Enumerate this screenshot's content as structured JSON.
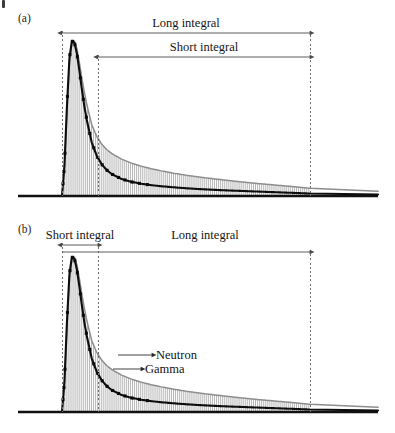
{
  "figure": {
    "kind": "pulse-shape-discrimination-diagram",
    "background_color": "#ffffff",
    "panels": [
      {
        "tag": "(a)",
        "tag_x": 18,
        "tag_y": 22,
        "description": "Neutron and gamma scintillation pulses with long integral starting at pulse onset and short integral starting after the peak",
        "baseline_y": 196,
        "baseline_x0": 18,
        "baseline_x1": 378,
        "gate_lines_x": [
          62,
          98,
          310
        ],
        "bands": [
          {
            "label": "Long integral",
            "label_x": 186,
            "label_y": 27,
            "arrow_y": 33,
            "x_start": 62,
            "x_end": 310,
            "heads": "both"
          },
          {
            "label": "Short integral",
            "label_x": 204,
            "label_y": 51,
            "arrow_y": 57,
            "x_start": 98,
            "x_end": 310,
            "heads": "both"
          }
        ],
        "annotations": []
      },
      {
        "tag": "(b)",
        "tag_x": 18,
        "tag_y": 233,
        "description": "Same pulses with short integral limited to the narrow leading-edge window and long integral spanning the full decay",
        "baseline_y": 412,
        "baseline_x0": 18,
        "baseline_x1": 378,
        "gate_lines_x": [
          62,
          98,
          310
        ],
        "bands": [
          {
            "label": "Short integral",
            "label_x": 80,
            "label_y": 239,
            "arrow_y": 245,
            "x_start": 62,
            "x_end": 98,
            "heads": "both"
          },
          {
            "label": "Long integral",
            "label_x": 205,
            "label_y": 239,
            "arrow_y": 252,
            "x_start": 62,
            "x_end": 310,
            "heads": "end"
          }
        ],
        "annotations": [
          {
            "label": "Neutron",
            "text_x": 156,
            "text_y": 359,
            "arrow_x_start": 118,
            "arrow_x_end": 152,
            "arrow_y": 355
          },
          {
            "label": "Gamma",
            "text_x": 145,
            "text_y": 373,
            "arrow_x_start": 113,
            "arrow_x_end": 141,
            "arrow_y": 369
          }
        ]
      }
    ],
    "colors": {
      "gamma_trace": "#0d0d0d",
      "neutron_trace": "#8d8d8d",
      "fill_hatch": "#a8a8a8",
      "dashed_gate": "#6f6f6f",
      "arrow": "#4a4a4a",
      "baseline": "#111111",
      "text": "#151515"
    }
  },
  "chart_data": {
    "type": "line",
    "title": "",
    "subtitle": "",
    "xlabel": "",
    "ylabel": "",
    "grid": false,
    "legend_position": "inline-annotation",
    "axis_visible": false,
    "xlim": [
      0,
      100
    ],
    "ylim": [
      0,
      1
    ],
    "gates": {
      "pulse_onset_x": 62,
      "peak_x": 74,
      "short_gate_split_x": 98,
      "gate_end_x": 310
    },
    "x": [
      0,
      1,
      2,
      3,
      4,
      5,
      6,
      7,
      8,
      9,
      10,
      12,
      14,
      16,
      18,
      20,
      24,
      28,
      32,
      36,
      40,
      45,
      50,
      55,
      60,
      65,
      70,
      75,
      80,
      85,
      90,
      95,
      100
    ],
    "series": [
      {
        "name": "Neutron",
        "color": "#8d8d8d",
        "style": "solid-light",
        "values": [
          0.0,
          0.18,
          0.55,
          0.86,
          0.99,
          1.0,
          0.95,
          0.86,
          0.76,
          0.67,
          0.59,
          0.46,
          0.385,
          0.335,
          0.3,
          0.275,
          0.238,
          0.212,
          0.192,
          0.176,
          0.162,
          0.147,
          0.134,
          0.123,
          0.113,
          0.104,
          0.095,
          0.087,
          0.079,
          0.072,
          0.065,
          0.058,
          0.05
        ]
      },
      {
        "name": "Gamma",
        "color": "#0d0d0d",
        "style": "solid-heavy-with-markers",
        "values": [
          0.0,
          0.2,
          0.58,
          0.89,
          1.0,
          0.99,
          0.92,
          0.81,
          0.69,
          0.58,
          0.49,
          0.345,
          0.26,
          0.205,
          0.168,
          0.142,
          0.11,
          0.091,
          0.079,
          0.07,
          0.063,
          0.056,
          0.05,
          0.045,
          0.041,
          0.037,
          0.034,
          0.031,
          0.028,
          0.025,
          0.022,
          0.019,
          0.016
        ]
      }
    ]
  }
}
